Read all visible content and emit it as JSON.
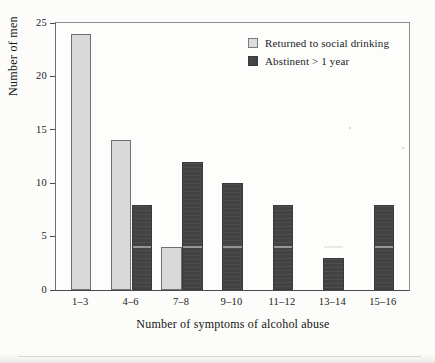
{
  "chart_data": {
    "type": "bar",
    "title": "",
    "xlabel": "Number of symptoms of alcohol abuse",
    "ylabel": "Number of men",
    "ylim": [
      0,
      25
    ],
    "yticks": [
      0,
      5,
      10,
      15,
      20,
      25
    ],
    "grid": false,
    "legend_position": "top-right",
    "categories": [
      "1–3",
      "4–6",
      "7–8",
      "9–10",
      "11–12",
      "13–14",
      "15–16"
    ],
    "series": [
      {
        "name": "Returned to social drinking",
        "color": "#d9d9d9",
        "values": [
          24,
          14,
          4,
          0,
          0,
          0,
          0
        ]
      },
      {
        "name": "Abstinent > 1 year",
        "color": "#464646",
        "values": [
          0,
          8,
          12,
          10,
          8,
          3,
          8
        ]
      }
    ]
  },
  "axes": {
    "y_title": "Number of men",
    "x_title": "Number of symptoms of alcohol abuse",
    "y_tick_labels": [
      "0",
      "5",
      "10",
      "15",
      "20",
      "25"
    ],
    "x_tick_labels": [
      "1–3",
      "4–6",
      "7–8",
      "9–10",
      "11–12",
      "13–14",
      "15–16"
    ]
  },
  "legend": {
    "items": [
      {
        "label": "Returned to social drinking",
        "swatch": "light"
      },
      {
        "label": "Abstinent > 1 year",
        "swatch": "dark"
      }
    ]
  }
}
